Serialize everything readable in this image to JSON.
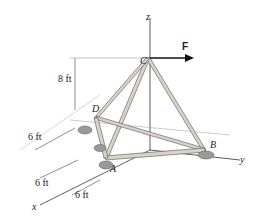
{
  "figure": {
    "axes": {
      "x_label": "x",
      "y_label": "y",
      "z_label": "z"
    },
    "points": {
      "C": "C",
      "D": "D",
      "A": "A",
      "B": "B"
    },
    "force": {
      "label": "F",
      "direction": "+y",
      "color": "#111111"
    },
    "dimensions": {
      "height": "8 ft",
      "dim_upper_left": "6 ft",
      "dim_lower_left": "6 ft",
      "dim_bottom": "6 ft"
    },
    "colors": {
      "member_fill": "#d9d2c7",
      "member_stroke": "#555555",
      "support": "#9a9a9a",
      "axis": "#333333",
      "dimension_line": "#444444"
    }
  }
}
